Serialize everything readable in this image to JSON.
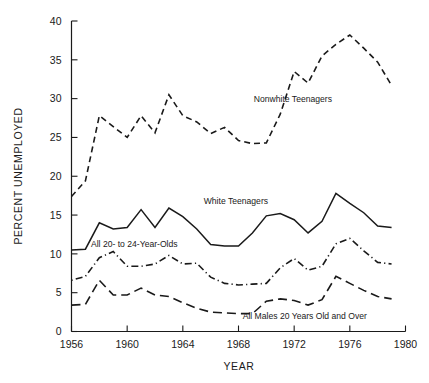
{
  "chart_data": {
    "type": "line",
    "title": "",
    "xlabel": "YEAR",
    "ylabel": "PERCENT UNEMPLOYED",
    "xlim": [
      1956,
      1980
    ],
    "ylim": [
      0,
      40
    ],
    "grid": false,
    "legend_position": "inline-annotations",
    "x_ticks": [
      1956,
      1960,
      1964,
      1968,
      1972,
      1976,
      1980
    ],
    "x_tick_labels": [
      "1956",
      "1960",
      "1964",
      "1968",
      "1972",
      "1976",
      "1980"
    ],
    "y_ticks": [
      0,
      5,
      10,
      15,
      20,
      25,
      30,
      35,
      40
    ],
    "y_tick_labels": [
      "0",
      "5",
      "10",
      "15",
      "20",
      "25",
      "30",
      "35",
      "40"
    ],
    "x": [
      1956,
      1957,
      1958,
      1959,
      1960,
      1961,
      1962,
      1963,
      1964,
      1965,
      1966,
      1967,
      1968,
      1969,
      1970,
      1971,
      1972,
      1973,
      1974,
      1975,
      1976,
      1977,
      1978,
      1979
    ],
    "series": [
      {
        "name": "Nonwhite Teenagers",
        "style": "dashed",
        "label": "Nonwhite Teenagers",
        "label_x": 1969.1,
        "label_y": 29.6,
        "values": [
          17.4,
          19.4,
          27.8,
          26.4,
          25.0,
          27.8,
          25.6,
          30.5,
          27.8,
          27.0,
          25.5,
          26.3,
          24.6,
          24.2,
          24.3,
          28.0,
          33.5,
          32.0,
          35.5,
          37.0,
          38.2,
          36.5,
          34.7,
          31.7
        ]
      },
      {
        "name": "White Teenagers",
        "style": "solid",
        "label": "White Teenagers",
        "label_x": 1965.5,
        "label_y": 16.4,
        "values": [
          10.5,
          10.6,
          14.0,
          13.2,
          13.4,
          15.7,
          13.4,
          15.9,
          14.8,
          13.2,
          11.2,
          11.0,
          11.0,
          12.7,
          14.9,
          15.2,
          14.4,
          12.7,
          14.2,
          17.8,
          16.5,
          15.3,
          13.6,
          13.4
        ]
      },
      {
        "name": "All 20- to 24-Year-Olds",
        "style": "dash-dot",
        "label": "All 20- to 24-Year-Olds",
        "label_x": 1957.4,
        "label_y": 10.9,
        "values": [
          6.6,
          7.1,
          9.5,
          10.3,
          8.4,
          8.4,
          8.7,
          9.8,
          8.7,
          8.8,
          7.0,
          6.2,
          6.0,
          6.1,
          6.2,
          8.2,
          9.4,
          7.9,
          8.4,
          11.3,
          12.0,
          10.4,
          8.9,
          8.7
        ]
      },
      {
        "name": "All Males 20 Years Old and Over",
        "style": "long-dash",
        "label": "All Males 20 Years Old and Over",
        "label_x": 1968.3,
        "label_y": 1.6,
        "values": [
          3.4,
          3.5,
          6.6,
          4.7,
          4.7,
          5.6,
          4.7,
          4.5,
          3.7,
          3.0,
          2.5,
          2.4,
          2.3,
          2.3,
          3.9,
          4.2,
          4.0,
          3.4,
          4.1,
          7.1,
          6.2,
          5.3,
          4.5,
          4.2
        ]
      }
    ]
  },
  "figure": {
    "background": "#ffffff",
    "ink_color": "#1a1a1a"
  }
}
